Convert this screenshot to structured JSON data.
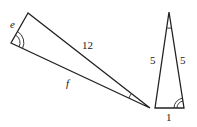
{
  "diagram": {
    "title": "",
    "triangle_left": {
      "vertices": [
        [
          28,
          13
        ],
        [
          11,
          43
        ],
        [
          150,
          108
        ]
      ],
      "labels": {
        "side_short": "e",
        "side_upper": "12",
        "side_lower": "f"
      },
      "angle_marks": [
        "double arc at vertex (11,43)",
        "single arc at vertex (150,108)"
      ]
    },
    "triangle_right": {
      "vertices": [
        [
          169,
          12
        ],
        [
          155,
          108
        ],
        [
          184,
          108
        ]
      ],
      "labels": {
        "side_left": "5",
        "side_right": "5",
        "side_base": "1"
      },
      "angle_marks": [
        "single arc at apex (169,12)",
        "double arc at vertex (184,108)"
      ]
    },
    "line_color": "#222222"
  }
}
